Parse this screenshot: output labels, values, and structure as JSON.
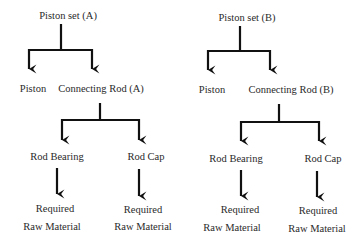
{
  "diagram": {
    "type": "tree",
    "colors": {
      "line": "#111111",
      "text": "#2a2a2a",
      "background": "#ffffff"
    },
    "trees": [
      {
        "root": {
          "label": "Piston set (A)"
        },
        "children": [
          {
            "label": "Piston"
          },
          {
            "label": "Connecting Rod (A)",
            "children": [
              {
                "label": "Rod Bearing",
                "leaf": {
                  "line1": "Required",
                  "line2": "Raw Material"
                }
              },
              {
                "label": "Rod Cap",
                "leaf": {
                  "line1": "Required",
                  "line2": "Raw Material"
                }
              }
            ]
          }
        ]
      },
      {
        "root": {
          "label": "Piston set (B)"
        },
        "children": [
          {
            "label": "Piston"
          },
          {
            "label": "Connecting Rod (B)",
            "children": [
              {
                "label": "Rod Bearing",
                "leaf": {
                  "line1": "Required",
                  "line2": "Raw Material"
                }
              },
              {
                "label": "Rod Cap",
                "leaf": {
                  "line1": "Required",
                  "line2": "Raw Material"
                }
              }
            ]
          }
        ]
      }
    ]
  }
}
